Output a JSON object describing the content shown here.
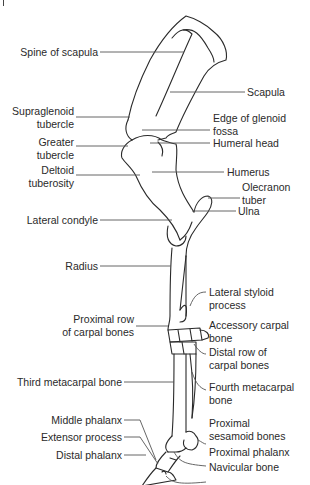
{
  "left_labels": [
    {
      "id": "spine-of-scapula",
      "lines": [
        "Spine of scapula"
      ]
    },
    {
      "id": "supraglenoid-tubercle",
      "lines": [
        "Supraglenoid",
        "tubercle"
      ]
    },
    {
      "id": "greater-tubercle",
      "lines": [
        "Greater",
        "tubercle"
      ]
    },
    {
      "id": "deltoid-tuberosity",
      "lines": [
        "Deltoid",
        "tuberosity"
      ]
    },
    {
      "id": "lateral-condyle",
      "lines": [
        "Lateral condyle"
      ]
    },
    {
      "id": "radius",
      "lines": [
        "Radius"
      ]
    },
    {
      "id": "proximal-row-carpal",
      "lines": [
        "Proximal row",
        "of carpal bones"
      ]
    },
    {
      "id": "third-metacarpal",
      "lines": [
        "Third metacarpal bone"
      ]
    },
    {
      "id": "middle-phalanx",
      "lines": [
        "Middle phalanx"
      ]
    },
    {
      "id": "extensor-process",
      "lines": [
        "Extensor process"
      ]
    },
    {
      "id": "distal-phalanx",
      "lines": [
        "Distal phalanx"
      ]
    }
  ],
  "right_labels": [
    {
      "id": "scapula",
      "lines": [
        "Scapula"
      ]
    },
    {
      "id": "edge-glenoid-fossa",
      "lines": [
        "Edge of glenoid",
        "fossa"
      ]
    },
    {
      "id": "humeral-head",
      "lines": [
        "Humeral head"
      ]
    },
    {
      "id": "humerus",
      "lines": [
        "Humerus"
      ]
    },
    {
      "id": "olecranon-tuber",
      "lines": [
        "Olecranon",
        "tuber"
      ]
    },
    {
      "id": "ulna",
      "lines": [
        "Ulna"
      ]
    },
    {
      "id": "lateral-styloid",
      "lines": [
        "Lateral styloid",
        "process"
      ]
    },
    {
      "id": "accessory-carpal",
      "lines": [
        "Accessory carpal",
        "bone"
      ]
    },
    {
      "id": "distal-row-carpal",
      "lines": [
        "Distal row of",
        "carpal bones"
      ]
    },
    {
      "id": "fourth-metacarpal",
      "lines": [
        "Fourth metacarpal",
        "bone"
      ]
    },
    {
      "id": "proximal-sesamoid",
      "lines": [
        "Proximal",
        "sesamoid bones"
      ]
    },
    {
      "id": "proximal-phalanx",
      "lines": [
        "Proximal phalanx"
      ]
    },
    {
      "id": "navicular-bone",
      "lines": [
        "Navicular bone"
      ]
    }
  ],
  "colors": {
    "line": "#2a2a2a",
    "leader": "#555555",
    "background": "#ffffff"
  }
}
